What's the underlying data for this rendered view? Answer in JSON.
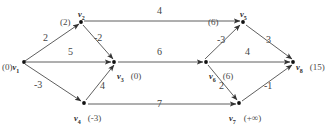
{
  "diagram": {
    "type": "directed-weighted-graph",
    "nodes": [
      {
        "id": "v1",
        "name": "v",
        "sub": "1",
        "dist": "(0)",
        "x": 24,
        "y": 62,
        "name_pos": "right",
        "dist_pos": "left"
      },
      {
        "id": "v2",
        "name": "v",
        "sub": "2",
        "dist": "(2)",
        "x": 81,
        "y": 22,
        "name_pos": "top",
        "dist_pos": "left"
      },
      {
        "id": "v3",
        "name": "v",
        "sub": "3",
        "dist": "(0)",
        "x": 114,
        "y": 62,
        "name_pos": "right",
        "dist_pos": "right"
      },
      {
        "id": "v4",
        "name": "v",
        "sub": "4",
        "dist": "(-3)",
        "x": 84,
        "y": 103,
        "name_pos": "below",
        "dist_pos": "right"
      },
      {
        "id": "v5",
        "name": "v",
        "sub": "5",
        "dist": "(6)",
        "x": 243,
        "y": 22,
        "name_pos": "top",
        "dist_pos": "left"
      },
      {
        "id": "v6",
        "name": "v",
        "sub": "6",
        "dist": "(6)",
        "x": 206,
        "y": 62,
        "name_pos": "right",
        "dist_pos": "right"
      },
      {
        "id": "v7",
        "name": "v",
        "sub": "7",
        "dist": "(+∞)",
        "x": 239,
        "y": 103,
        "name_pos": "below",
        "dist_pos": "right"
      },
      {
        "id": "v8",
        "name": "v",
        "sub": "8",
        "dist": "(15)",
        "x": 293,
        "y": 62,
        "name_pos": "right",
        "dist_pos": "right"
      }
    ],
    "edges": [
      {
        "from": "v1",
        "to": "v2",
        "weight": "2",
        "lx": 43,
        "ly": 38
      },
      {
        "from": "v1",
        "to": "v3",
        "weight": "5",
        "lx": 68,
        "ly": 52
      },
      {
        "from": "v1",
        "to": "v4",
        "weight": "-3",
        "lx": 39,
        "ly": 85
      },
      {
        "from": "v2",
        "to": "v3",
        "weight": "-2",
        "lx": 98,
        "ly": 38
      },
      {
        "from": "v4",
        "to": "v3",
        "weight": "4",
        "lx": 100,
        "ly": 86
      },
      {
        "from": "v2",
        "to": "v5",
        "weight": "4",
        "lx": 160,
        "ly": 11
      },
      {
        "from": "v3",
        "to": "v6",
        "weight": "6",
        "lx": 159,
        "ly": 52
      },
      {
        "from": "v4",
        "to": "v7",
        "weight": "7",
        "lx": 160,
        "ly": 104
      },
      {
        "from": "v6",
        "to": "v5",
        "weight": "-3",
        "lx": 222,
        "ly": 40
      },
      {
        "from": "v5",
        "to": "v8",
        "weight": "3",
        "lx": 268,
        "ly": 40
      },
      {
        "from": "v6",
        "to": "v8",
        "weight": "4",
        "lx": 248,
        "ly": 52
      },
      {
        "from": "v6",
        "to": "v7",
        "weight": "2",
        "lx": 221,
        "ly": 86
      },
      {
        "from": "v7",
        "to": "v8",
        "weight": "-1",
        "lx": 268,
        "ly": 86
      }
    ],
    "colors": {
      "edge": "#4d4d4d",
      "node": "#1a1a1a",
      "text": "#3a3a3a",
      "background": "#ffffff"
    }
  }
}
